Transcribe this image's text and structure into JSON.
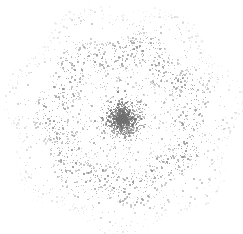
{
  "figure": {
    "width": 243,
    "height": 234,
    "background_color": "#ffffff",
    "title": "",
    "has_axes": false,
    "has_grid": false,
    "has_legend": false,
    "has_tick_labels": false
  },
  "chart_data": {
    "type": "scatter",
    "title": "",
    "subtitle": "",
    "xlabel": "",
    "ylabel": "",
    "xlim": [
      0,
      243
    ],
    "ylim": [
      0,
      234
    ],
    "grid": false,
    "legend": false,
    "legend_position": "none",
    "marker": {
      "shape": "point",
      "size_px": 1.3,
      "color": "#8a8a8a",
      "color_core": "#6f6f6f",
      "color_ring": "#8f8f8f",
      "color_outer": "#a8a8a8",
      "opacity": 0.75
    },
    "center": {
      "x": 122,
      "y": 118
    },
    "structure": {
      "components": [
        {
          "name": "dense-core",
          "kind": "gaussian-disc",
          "radius_inner": 0,
          "radius_outer": 24,
          "n_points": 1450,
          "sigma": 11,
          "color": "#6f6f6f",
          "density": "very-high"
        },
        {
          "name": "sparse-gap",
          "kind": "annulus",
          "radius_inner": 25,
          "radius_outer": 48,
          "n_points": 210,
          "color": "#a5a5a5",
          "density": "very-low"
        },
        {
          "name": "main-ring",
          "kind": "annulus",
          "radius_inner": 49,
          "radius_outer": 86,
          "n_points": 1500,
          "color": "#8f8f8f",
          "density": "moderate"
        },
        {
          "name": "outer-halo",
          "kind": "annulus-fading",
          "radius_inner": 86,
          "radius_outer": 116,
          "n_points": 620,
          "color": "#adadad",
          "density": "low-fading"
        }
      ]
    },
    "radial_density_profile": {
      "radius": [
        0,
        6,
        12,
        18,
        24,
        30,
        36,
        42,
        48,
        54,
        60,
        66,
        72,
        78,
        84,
        90,
        96,
        102,
        108,
        114,
        120
      ],
      "relative_density": [
        1.0,
        0.96,
        0.82,
        0.55,
        0.3,
        0.12,
        0.08,
        0.07,
        0.09,
        0.22,
        0.38,
        0.42,
        0.4,
        0.35,
        0.28,
        0.2,
        0.13,
        0.08,
        0.04,
        0.015,
        0.0
      ]
    },
    "total_points": 3780,
    "random_seed": 20240517
  }
}
